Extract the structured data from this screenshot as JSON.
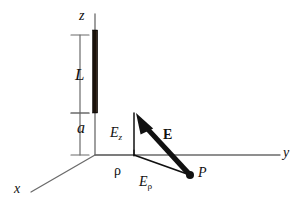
{
  "figure": {
    "colors": {
      "axis": "#6b6b6b",
      "rod": "#1a120b",
      "vector": "#111111",
      "text": "#111111",
      "background": "#ffffff"
    },
    "labels": {
      "z_axis": "z",
      "x_axis": "x",
      "y_axis": "y",
      "rod_length": "L",
      "gap": "a",
      "field_z_component": "E",
      "field_z_component_sub": "z",
      "field_vector": "E",
      "radial_distance": "ρ",
      "field_rho_component": "E",
      "field_rho_component_sub": "ρ",
      "field_point": "P"
    },
    "geometry": {
      "origin": [
        95,
        155
      ],
      "z_axis_top": [
        95,
        14
      ],
      "y_axis_end": [
        280,
        155
      ],
      "x_axis_end": [
        31,
        192
      ],
      "rod_top": [
        95,
        30
      ],
      "rod_bottom": [
        95,
        113
      ],
      "rod_width_px": 5,
      "bracket_L_top_y": 35,
      "bracket_L_bottom_y": 113,
      "bracket_a_top_y": 113,
      "bracket_a_bottom_y": 155,
      "bracket_x": 80,
      "point_P": [
        190,
        175
      ],
      "foot_of_perp": [
        134,
        155
      ],
      "vector_tip": [
        136,
        113
      ],
      "vector_tail": [
        190,
        175
      ]
    }
  }
}
